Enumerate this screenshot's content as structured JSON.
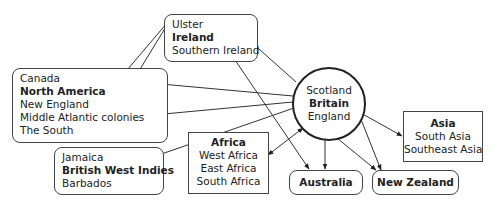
{
  "diagram": {
    "hub": {
      "title": "Britain",
      "lines": [
        "Scotland",
        "Britain",
        "England"
      ]
    },
    "nodes": {
      "ireland": {
        "title": "Ireland",
        "lines": [
          "Ulster",
          "Ireland",
          "Southern Ireland"
        ]
      },
      "north_america": {
        "title": "North America",
        "lines": [
          "Canada",
          "North America",
          "New England",
          "Middle Atlantic colonies",
          "The South"
        ]
      },
      "west_indies": {
        "title": "British West Indies",
        "lines": [
          "Jamaica",
          "British West Indies",
          "Barbados"
        ]
      },
      "africa": {
        "title": "Africa",
        "lines": [
          "Africa",
          "West Africa",
          "East Africa",
          "South Africa"
        ]
      },
      "asia": {
        "title": "Asia",
        "lines": [
          "Asia",
          "South Asia",
          "Southeast Asia"
        ]
      },
      "australia": {
        "title": "Australia"
      },
      "new_zealand": {
        "title": "New Zealand"
      }
    },
    "edges": [
      {
        "from": "Britain",
        "to": "Ireland",
        "type": "one-way"
      },
      {
        "from": "Britain",
        "to": "Canada",
        "type": "one-way"
      },
      {
        "from": "Britain",
        "to": "Middle Atlantic colonies",
        "type": "one-way"
      },
      {
        "from": "Britain",
        "to": "British West Indies",
        "type": "one-way"
      },
      {
        "from": "Britain",
        "to": "Africa",
        "type": "two-way"
      },
      {
        "from": "Britain",
        "to": "Asia",
        "type": "two-way"
      },
      {
        "from": "England",
        "to": "Australia",
        "type": "one-way"
      },
      {
        "from": "England",
        "to": "New Zealand",
        "type": "one-way"
      },
      {
        "from": "Scotland",
        "to": "New Zealand",
        "type": "one-way"
      },
      {
        "from": "Ulster",
        "to": "The South",
        "type": "one-way"
      },
      {
        "from": "Ulster",
        "to": "Middle Atlantic colonies",
        "type": "one-way"
      },
      {
        "from": "Southern Ireland",
        "to": "Australia",
        "type": "one-way"
      }
    ]
  }
}
